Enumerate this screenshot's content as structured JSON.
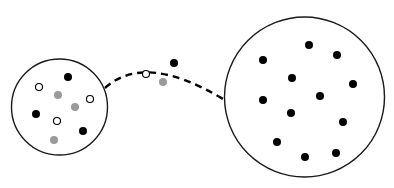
{
  "canvas": {
    "width": 394,
    "height": 188,
    "background": "#ffffff"
  },
  "colors": {
    "stroke": "#1a1a1a",
    "black_dot": "#000000",
    "gray_dot": "#9a9a9a",
    "open_dot_fill": "#ffffff"
  },
  "small_circle": {
    "cx": 59.5,
    "cy": 107,
    "r": 48,
    "dots": [
      {
        "type": "black",
        "x": 68,
        "y": 77
      },
      {
        "type": "open",
        "x": 39,
        "y": 87
      },
      {
        "type": "gray",
        "x": 58,
        "y": 95
      },
      {
        "type": "open",
        "x": 90,
        "y": 99
      },
      {
        "type": "gray",
        "x": 75,
        "y": 107
      },
      {
        "type": "black",
        "x": 36,
        "y": 114
      },
      {
        "type": "open",
        "x": 57,
        "y": 121
      },
      {
        "type": "black",
        "x": 83,
        "y": 131
      },
      {
        "type": "gray",
        "x": 54,
        "y": 140
      }
    ]
  },
  "connector": {
    "style": "dashed",
    "path": "M 105 88 Q 145 52 223 99",
    "dots": [
      {
        "type": "open",
        "x": 146,
        "y": 74
      },
      {
        "type": "black",
        "x": 174,
        "y": 63
      },
      {
        "type": "gray",
        "x": 163,
        "y": 82
      }
    ]
  },
  "large_circle": {
    "cx": 304.5,
    "cy": 97,
    "r": 80,
    "dots": [
      {
        "type": "black",
        "x": 309,
        "y": 45
      },
      {
        "type": "black",
        "x": 337,
        "y": 55
      },
      {
        "type": "black",
        "x": 263,
        "y": 60
      },
      {
        "type": "black",
        "x": 292,
        "y": 78
      },
      {
        "type": "black",
        "x": 353,
        "y": 84
      },
      {
        "type": "black",
        "x": 263,
        "y": 100
      },
      {
        "type": "black",
        "x": 320,
        "y": 96
      },
      {
        "type": "black",
        "x": 291,
        "y": 113
      },
      {
        "type": "black",
        "x": 343,
        "y": 122
      },
      {
        "type": "black",
        "x": 277,
        "y": 142
      },
      {
        "type": "black",
        "x": 305,
        "y": 157
      },
      {
        "type": "black",
        "x": 336,
        "y": 153
      }
    ]
  }
}
